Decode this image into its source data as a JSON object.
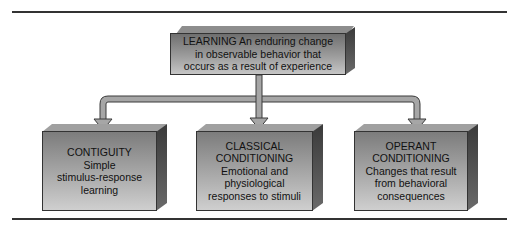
{
  "diagram": {
    "root": {
      "title": "LEARNING",
      "lines": [
        "LEARNING An enduring change",
        "in observable behavior that",
        "occurs as a result of experience"
      ]
    },
    "children": [
      {
        "id": "contiguity",
        "lines": [
          "CONTIGUITY",
          "Simple",
          "stimulus-response",
          "learning"
        ]
      },
      {
        "id": "classical",
        "lines": [
          "CLASSICAL",
          "CONDITIONING",
          "Emotional and",
          "physiological",
          "responses to stimuli"
        ]
      },
      {
        "id": "operant",
        "lines": [
          "OPERANT",
          "CONDITIONING",
          "Changes that result",
          "from behavioral",
          "consequences"
        ]
      }
    ],
    "colors": {
      "arrow_fill": "#a6a6a6",
      "arrow_stroke": "#3a3a3a",
      "box_front_top": "#7c7c7c",
      "box_front_bottom": "#cfcfcf",
      "box_side": "#3a3a3a",
      "rule": "#333333"
    }
  }
}
